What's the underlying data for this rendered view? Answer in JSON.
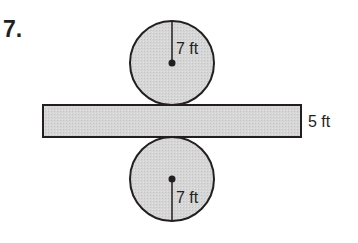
{
  "problem": {
    "number": "7."
  },
  "figure": {
    "type": "cylinder-net",
    "fill_color": "#d4d4d4",
    "stroke_color": "#231f20",
    "top_circle": {
      "radius_label": "7 ft"
    },
    "rectangle": {
      "height_label": "5 ft"
    },
    "bottom_circle": {
      "radius_label": "7 ft"
    }
  }
}
